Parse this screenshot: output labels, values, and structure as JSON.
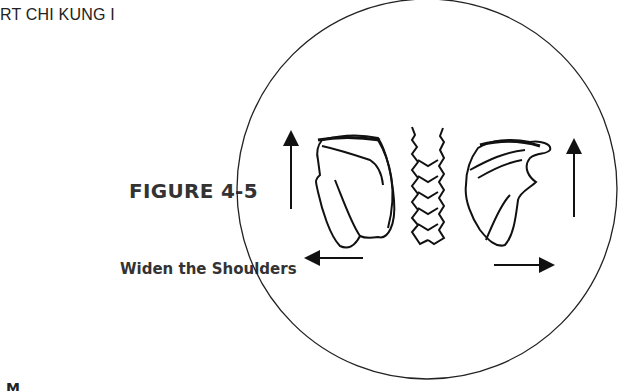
{
  "page": {
    "running_header": "RT CHI KUNG I",
    "figure_number": "FIGURE 4-5",
    "figure_caption": "Widen the Shoulders",
    "bottom_fragment": "M"
  },
  "illustration": {
    "frame": "circle",
    "elements": [
      "left-scapula",
      "spine-vertebrae",
      "right-scapula",
      "left-up-arrow",
      "right-up-arrow",
      "left-outward-arrow",
      "right-outward-arrow"
    ]
  }
}
